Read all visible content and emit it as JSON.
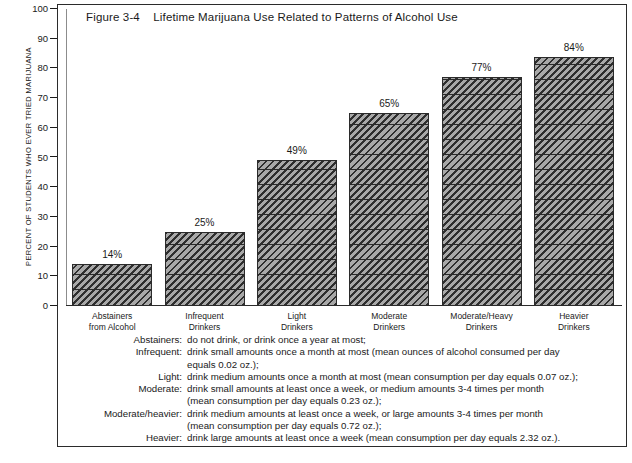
{
  "figure": {
    "title": "Figure 3-4    Lifetime Marijuana Use Related to Patterns of Alcohol Use",
    "y_axis_label": "PERCENT OF STUDENTS WHO EVER TRIED MARIJUANA"
  },
  "chart_data": {
    "type": "bar",
    "title": "Figure 3-4    Lifetime Marijuana Use Related to Patterns of Alcohol Use",
    "xlabel": "",
    "ylabel": "PERCENT OF STUDENTS WHO EVER TRIED MARIJUANA",
    "ylim": [
      0,
      100
    ],
    "yticks": [
      0,
      10,
      20,
      30,
      40,
      50,
      60,
      70,
      80,
      90,
      100
    ],
    "grid": false,
    "legend": "none",
    "categories": [
      "Abstainers\nfrom Alcohol",
      "Infrequent\nDrinkers",
      "Light\nDrinkers",
      "Moderate\nDrinkers",
      "Moderate/Heavy\nDrinkers",
      "Heavier\nDrinkers"
    ],
    "values": [
      14,
      25,
      49,
      65,
      77,
      84
    ],
    "value_labels": [
      "14%",
      "25%",
      "49%",
      "65%",
      "77%",
      "84%"
    ],
    "bar_fill": "#8a8a8a",
    "bar_hatch": "diagonal",
    "bar_edge": "#2b2b2b"
  },
  "notes": [
    {
      "term": "Abstainers:",
      "desc": "do not drink, or drink once a year at most;",
      "cont": ""
    },
    {
      "term": "Infrequent:",
      "desc": "drink small amounts once a month at most (mean ounces of alcohol consumed per day",
      "cont": "equals 0.02 oz.);"
    },
    {
      "term": "Light:",
      "desc": "drink medium amounts once a month at most (mean consumption per day equals 0.07 oz.);",
      "cont": ""
    },
    {
      "term": "Moderate:",
      "desc": "drink small amounts at least once a week, or medium amounts 3-4 times per month",
      "cont": "(mean consumption per day equals 0.23 oz.);"
    },
    {
      "term": "Moderate/heavier:",
      "desc": "drink medium amounts at least once a week, or large amounts 3-4 times per month",
      "cont": "(mean consumption per day equals 0.72 oz.);"
    },
    {
      "term": "Heavier:",
      "desc": "drink large amounts at least once a week (mean consumption per day equals 2.32 oz.).",
      "cont": ""
    }
  ]
}
